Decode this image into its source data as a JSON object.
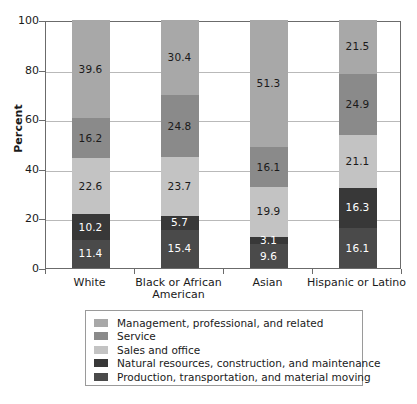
{
  "chart_data": {
    "type": "bar",
    "subtype": "stacked-bar-100",
    "title": "",
    "xlabel": "",
    "ylabel": "Percent",
    "ylim": [
      0,
      100
    ],
    "yticks": [
      0,
      20,
      40,
      60,
      80,
      100
    ],
    "grid": true,
    "legend_position": "bottom",
    "categories": [
      "White",
      "Black or African American",
      "Asian",
      "Hispanic or Latino"
    ],
    "category_lines": [
      [
        "White"
      ],
      [
        "Black or African",
        "American"
      ],
      [
        "Asian"
      ],
      [
        "Hispanic or Latino"
      ]
    ],
    "series": [
      {
        "name": "Management, professional, and related",
        "color": "#a8a8a8",
        "label_color": "#1a1a1a",
        "values": [
          39.6,
          30.4,
          51.3,
          21.5
        ]
      },
      {
        "name": "Service",
        "color": "#8a8a8a",
        "label_color": "#1a1a1a",
        "values": [
          16.2,
          24.8,
          16.1,
          24.9
        ]
      },
      {
        "name": "Sales and office",
        "color": "#c3c3c3",
        "label_color": "#1a1a1a",
        "values": [
          22.6,
          23.7,
          19.9,
          21.1
        ]
      },
      {
        "name": "Natural resources, construction, and maintenance",
        "color": "#383838",
        "label_color": "#ffffff",
        "values": [
          10.2,
          5.7,
          3.1,
          16.3
        ]
      },
      {
        "name": "Production, transportation, and material moving",
        "color": "#4a4a4a",
        "label_color": "#ffffff",
        "values": [
          11.4,
          15.4,
          9.6,
          16.1
        ]
      }
    ]
  },
  "axis": {
    "y_title": "Percent"
  }
}
